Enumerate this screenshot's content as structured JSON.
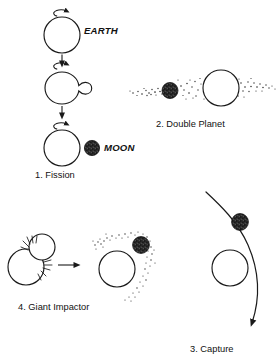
{
  "figure": {
    "background_color": "#ffffff",
    "ink_color": "#1a1a1a",
    "moon_color": "#2b2b2b",
    "width": 279,
    "height": 360
  },
  "panels": [
    {
      "id": "fission",
      "caption": "1. Fission",
      "labels": {
        "earth": "EARTH",
        "moon": "MOON"
      },
      "stages": [
        {
          "name": "rotating-earth",
          "shape": "circle",
          "spin": "clockwise"
        },
        {
          "name": "deforming-earth",
          "shape": "pear",
          "spin": "clockwise"
        },
        {
          "name": "earth-and-moon",
          "shape": "circle-plus-moon",
          "spin": "clockwise"
        }
      ],
      "arrows": 2
    },
    {
      "id": "double-planet",
      "caption": "2. Double Planet",
      "description": "co-accretion from a flattened dust band",
      "bodies": [
        "earth",
        "moon"
      ],
      "dust_band": true
    },
    {
      "id": "capture",
      "caption": "3. Capture",
      "description": "moon on a hyperbolic trajectory past earth",
      "bodies": [
        "earth",
        "moon"
      ],
      "trajectory_arrow": true
    },
    {
      "id": "giant-impactor",
      "caption": "4. Giant Impactor",
      "description": "collision ejects debris that accretes into the moon",
      "before": {
        "bodies": [
          "proto-earth",
          "impactor"
        ],
        "impact_sparks": true
      },
      "after": {
        "bodies": [
          "earth",
          "moon"
        ],
        "debris_arc": true
      },
      "transition_arrow": true
    }
  ]
}
